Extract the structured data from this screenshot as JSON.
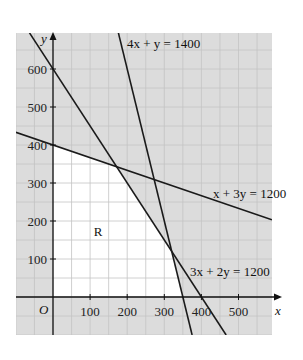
{
  "chart_data": {
    "type": "line",
    "title": "",
    "xlabel": "x",
    "ylabel": "y",
    "origin_label": "O",
    "xlim": [
      -100,
      590
    ],
    "ylim": [
      -100,
      695
    ],
    "grid": true,
    "grid_minor_step": 50,
    "x_ticks": [
      100,
      200,
      300,
      400,
      500
    ],
    "y_ticks": [
      100,
      200,
      300,
      400,
      500,
      600
    ],
    "series": [
      {
        "name": "4x + y = 1400",
        "a": 4,
        "b": 1,
        "c": 1400,
        "x_intercept": 350,
        "y_intercept": 1400
      },
      {
        "name": "3x + 2y = 1200",
        "a": 3,
        "b": 2,
        "c": 1200,
        "x_intercept": 400,
        "y_intercept": 600
      },
      {
        "name": "x + 3y = 1200",
        "a": 1,
        "b": 3,
        "c": 1200,
        "x_intercept": 1200,
        "y_intercept": 400
      }
    ],
    "feasible_region": {
      "label": "R",
      "vertices": [
        [
          0,
          0
        ],
        [
          0,
          400
        ],
        [
          171.4,
          342.9
        ],
        [
          320,
          120
        ],
        [
          350,
          0
        ]
      ]
    },
    "annotations": [
      {
        "text": "4x + y = 1400",
        "x": 250,
        "y": 665
      },
      {
        "text": "x + 3y = 1200",
        "x": 450,
        "y": 300
      },
      {
        "text": "3x + 2y = 1200",
        "x": 420,
        "y": 70
      },
      {
        "text": "R",
        "x": 125,
        "y": 220
      }
    ],
    "colors": {
      "shade": "#dcdcdc",
      "grid": "#c4c4c4",
      "line": "#1a1a1a",
      "feasible": "#ffffff"
    }
  }
}
